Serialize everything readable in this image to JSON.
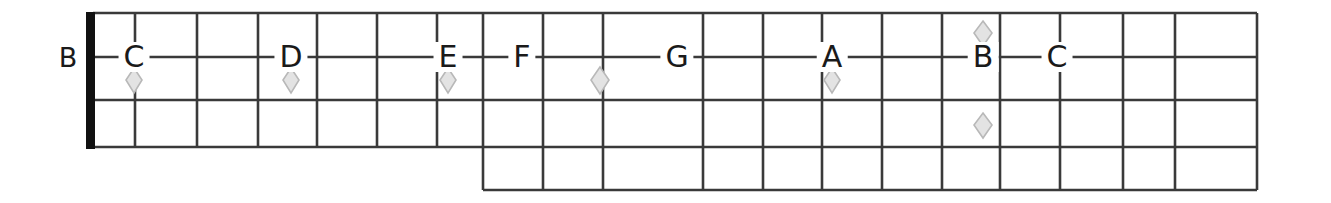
{
  "diagram": {
    "type": "guitar-fretboard",
    "title": "",
    "open_string_label": "B",
    "colors": {
      "line": "#3a3a3a",
      "nut": "#111111",
      "text": "#1a1a1a",
      "marker_fill": "#e3e3e3",
      "marker_stroke": "#b8b8b8",
      "background": "#ffffff"
    },
    "geometry": {
      "nut_x": 93,
      "board_right": 1257,
      "string_lines_y": [
        13,
        57,
        100,
        147,
        190
      ],
      "lower_section_start_x": 483,
      "fret_lines_x": [
        135,
        197,
        258,
        317,
        377,
        437,
        483,
        543,
        603,
        703,
        763,
        822,
        882,
        942,
        1000,
        1060,
        1123,
        1175
      ],
      "marker_note_row_y": 57
    },
    "note_labels": [
      {
        "text": "C",
        "x": 134,
        "y": 57
      },
      {
        "text": "D",
        "x": 291,
        "y": 57
      },
      {
        "text": "E",
        "x": 448,
        "y": 57
      },
      {
        "text": "F",
        "x": 522,
        "y": 57
      },
      {
        "text": "G",
        "x": 677,
        "y": 57
      },
      {
        "text": "A",
        "x": 832,
        "y": 57
      },
      {
        "text": "B",
        "x": 983,
        "y": 57
      },
      {
        "text": "C",
        "x": 1057,
        "y": 57
      }
    ],
    "diamond_markers": [
      {
        "name": "marker-c-3rd-fret",
        "x": 134,
        "y": 80
      },
      {
        "name": "marker-d-5th-fret",
        "x": 291,
        "y": 80
      },
      {
        "name": "marker-e-7th-fret",
        "x": 448,
        "y": 80
      },
      {
        "name": "marker-unlabeled-9th-fret",
        "x": 600,
        "y": 80
      },
      {
        "name": "marker-a-12th-fret",
        "x": 832,
        "y": 80
      },
      {
        "name": "marker-b-upper",
        "x": 983,
        "y": 33
      },
      {
        "name": "marker-b-lower",
        "x": 983,
        "y": 125
      }
    ]
  }
}
